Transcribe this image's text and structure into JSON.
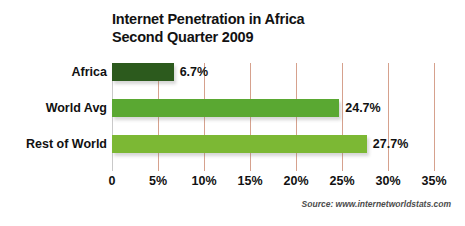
{
  "chart_data": {
    "type": "bar",
    "orientation": "horizontal",
    "title": "Internet Penetration in Africa Second Quarter 2009",
    "title_lines": [
      "Internet Penetration in Africa",
      "Second Quarter 2009"
    ],
    "categories": [
      "Africa",
      "World Avg",
      "Rest of World"
    ],
    "values": [
      6.7,
      24.7,
      27.7
    ],
    "value_labels": [
      "6.7%",
      "24.7%",
      "27.7%"
    ],
    "bar_colors": [
      "#2c5a1d",
      "#5aa832",
      "#7cb834"
    ],
    "xlabel": "",
    "ylabel": "",
    "xlim": [
      0,
      35
    ],
    "xticks": [
      0,
      5,
      10,
      15,
      20,
      25,
      30,
      35
    ],
    "xtick_labels": [
      "0",
      "5%",
      "10%",
      "15%",
      "20%",
      "25%",
      "30%",
      "35%"
    ],
    "grid": true,
    "grid_color": "#d6a18d",
    "legend": null,
    "annotations": {
      "source": "Source: www.internetworldstats.com"
    }
  }
}
